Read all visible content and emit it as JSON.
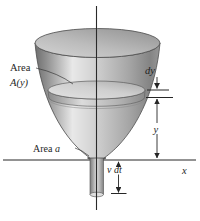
{
  "diagram": {
    "labels": {
      "upper_area_prefix": "Area",
      "upper_area_symbol": "A(y)",
      "outlet_area_prefix": "Area ",
      "outlet_area_symbol": "a",
      "slab_thickness": "dy",
      "water_height": "y",
      "outflow_distance": "v dt",
      "x_axis": "x"
    },
    "colors": {
      "background": "#ffffff",
      "ink": "#262626",
      "bowl_edge_dark": "#6e6e6e",
      "bowl_highlight": "#e8e8e8",
      "bowl_mid": "#b5b5b5",
      "rim_surface_dark": "#949494",
      "rim_surface_light": "#d4d4d4",
      "disk_light": "#e3e3e3",
      "disk_shade": "#a8a8a8",
      "spout_light": "#dddddd",
      "spout_dark": "#7d7d7d"
    }
  }
}
